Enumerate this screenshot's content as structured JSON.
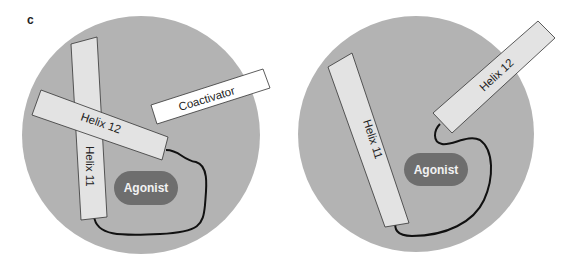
{
  "panel_label": "c",
  "colors": {
    "background": "#ffffff",
    "domain_circle": "#b3b3b3",
    "helix_fill": "#e3e3e3",
    "coactivator_fill": "#ffffff",
    "agonist_fill": "#6e6e6e",
    "agonist_text": "#f2f2f2",
    "outline": "#333333",
    "loop": "#111111"
  },
  "left_diagram": {
    "helix11_label": "Helix 11",
    "helix12_label": "Helix 12",
    "coactivator_label": "Coactivator",
    "agonist_label": "Agonist"
  },
  "right_diagram": {
    "helix11_label": "Helix 11",
    "helix12_label": "Helix 12",
    "agonist_label": "Agonist"
  }
}
